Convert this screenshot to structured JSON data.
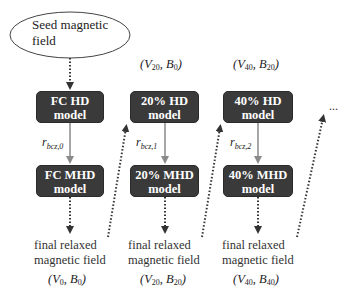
{
  "seed": {
    "label": "Seed magnetic field"
  },
  "columns": [
    {
      "hd_line1": "FC HD",
      "hd_line2": "model",
      "mhd_line1": "FC MHD",
      "mhd_line2": "model",
      "r_label_base": "r",
      "r_label_sub": "bcz,0",
      "final_line1": "final relaxed",
      "final_line2": "magnetic field",
      "output": {
        "V": "V",
        "V_sub": "0",
        "B": "B",
        "B_sub": "0"
      }
    },
    {
      "input": {
        "V": "V",
        "V_sub": "20",
        "B": "B",
        "B_sub": "0"
      },
      "hd_line1": "20% HD",
      "hd_line2": "model",
      "mhd_line1": "20% MHD",
      "mhd_line2": "model",
      "r_label_base": "r",
      "r_label_sub": "bcz,1",
      "final_line1": "final relaxed",
      "final_line2": "magnetic field",
      "output": {
        "V": "V",
        "V_sub": "20",
        "B": "B",
        "B_sub": "20"
      }
    },
    {
      "input": {
        "V": "V",
        "V_sub": "40",
        "B": "B",
        "B_sub": "20"
      },
      "hd_line1": "40% HD",
      "hd_line2": "model",
      "mhd_line1": "40% MHD",
      "mhd_line2": "model",
      "r_label_base": "r",
      "r_label_sub": "bcz,2",
      "final_line1": "final relaxed",
      "final_line2": "magnetic field",
      "output": {
        "V": "V",
        "V_sub": "40",
        "B": "B",
        "B_sub": "40"
      }
    }
  ],
  "continuation": "...",
  "colors": {
    "box_fill": "#3a3a3a",
    "box_text": "#ffffff",
    "solid_arrow": "#8a8a8a",
    "dotted_arrow": "#333333"
  }
}
